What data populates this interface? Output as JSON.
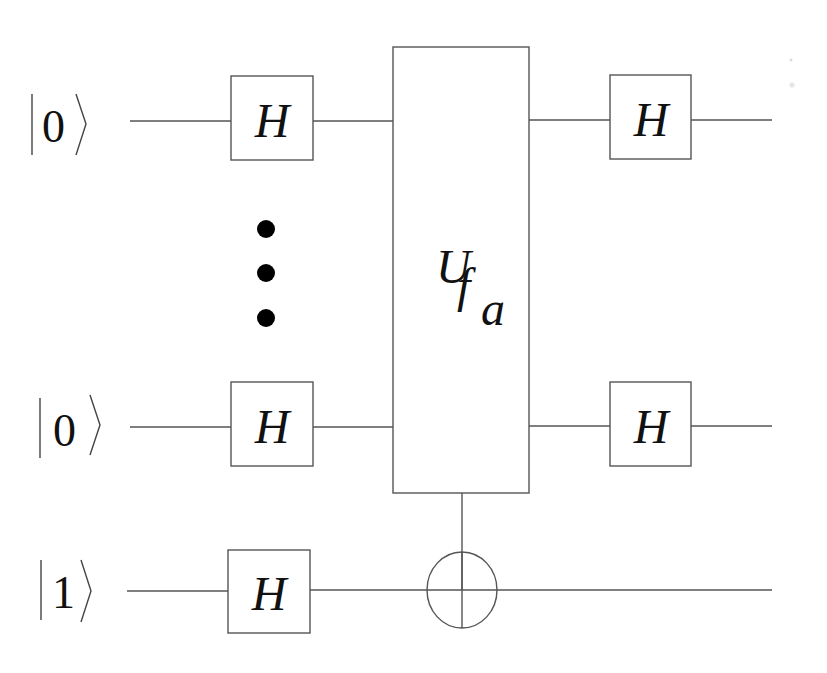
{
  "diagram": {
    "type": "quantum-circuit",
    "qubits": [
      {
        "label": "0",
        "ket": "|0⟩",
        "y": 121
      },
      {
        "label": "0",
        "ket": "|0⟩",
        "y": 427
      },
      {
        "label": "1",
        "ket": "|1⟩",
        "y": 590
      }
    ],
    "ellipsis": "⋮",
    "gates": {
      "hadamard_label": "H",
      "oracle": {
        "label": "U",
        "subscript": "f",
        "subsubscript": "a"
      },
      "target": "⊕"
    },
    "colors": {
      "line": "#555555",
      "text": "#111111",
      "background": "#ffffff"
    }
  }
}
